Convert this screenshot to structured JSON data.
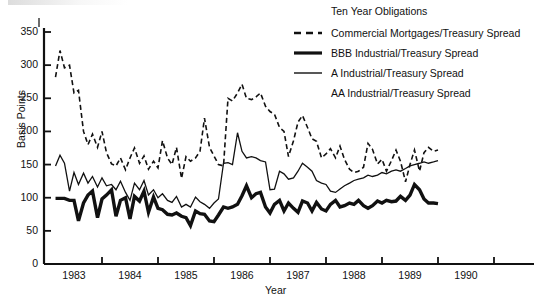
{
  "chart_data": {
    "type": "line",
    "title": "",
    "xlabel": "Year",
    "ylabel": "Basis Points",
    "xlim": [
      1982.6,
      1990.5
    ],
    "ylim": [
      0,
      365
    ],
    "yticks": [
      0,
      50,
      100,
      150,
      200,
      250,
      300,
      350
    ],
    "xticks": [
      1983,
      1984,
      1985,
      1986,
      1987,
      1988,
      1989,
      1990
    ],
    "grid": false,
    "legend_position": "top-right",
    "legend_title": "Ten Year Obligations",
    "series": [
      {
        "name": "Commercial Mortgages/Treasury Spread",
        "style": "dashed",
        "width": 1.6,
        "color": "#111111",
        "x": [
          1982.67,
          1982.75,
          1982.83,
          1982.92,
          1983.0,
          1983.08,
          1983.17,
          1983.25,
          1983.33,
          1983.42,
          1983.5,
          1983.58,
          1983.67,
          1983.75,
          1983.83,
          1983.92,
          1984.0,
          1984.08,
          1984.17,
          1984.25,
          1984.33,
          1984.42,
          1984.5,
          1984.58,
          1984.67,
          1984.75,
          1984.83,
          1984.92,
          1985.0,
          1985.08,
          1985.17,
          1985.25,
          1985.33,
          1985.42,
          1985.5,
          1985.58,
          1985.67,
          1985.75,
          1985.83,
          1985.92,
          1986.0,
          1986.08,
          1986.17,
          1986.25,
          1986.33,
          1986.42,
          1986.5,
          1986.58,
          1986.67,
          1986.75,
          1986.83,
          1986.92,
          1987.0,
          1987.08,
          1987.17,
          1987.25,
          1987.33,
          1987.42,
          1987.5,
          1987.58,
          1987.67,
          1987.75,
          1987.83,
          1987.92,
          1988.0,
          1988.08,
          1988.17,
          1988.25,
          1988.33,
          1988.42,
          1988.5,
          1988.58,
          1988.67,
          1988.75,
          1988.83,
          1988.92,
          1989.0,
          1989.08,
          1989.17,
          1989.25,
          1989.33,
          1989.42,
          1989.5
        ],
        "values": [
          282,
          322,
          296,
          300,
          258,
          262,
          200,
          180,
          196,
          176,
          200,
          168,
          151,
          148,
          160,
          142,
          160,
          175,
          152,
          163,
          143,
          155,
          145,
          186,
          160,
          150,
          176,
          129,
          162,
          155,
          160,
          170,
          220,
          176,
          163,
          150,
          148,
          250,
          246,
          258,
          271,
          250,
          248,
          252,
          258,
          238,
          230,
          226,
          206,
          200,
          162,
          186,
          214,
          224,
          206,
          189,
          185,
          160,
          166,
          174,
          160,
          178,
          158,
          143,
          138,
          140,
          146,
          182,
          173,
          151,
          158,
          140,
          156,
          172,
          155,
          124,
          150,
          172,
          140,
          168,
          176,
          170,
          172
        ]
      },
      {
        "name": "BBB Industrial/Treasury Spread",
        "style": "solid",
        "width": 3.4,
        "color": "#111111",
        "x": [
          1982.67,
          1982.75,
          1982.83,
          1982.92,
          1983.0,
          1983.08,
          1983.17,
          1983.25,
          1983.33,
          1983.42,
          1983.5,
          1983.58,
          1983.67,
          1983.75,
          1983.83,
          1983.92,
          1984.0,
          1984.08,
          1984.17,
          1984.25,
          1984.33,
          1984.42,
          1984.5,
          1984.58,
          1984.67,
          1984.75,
          1984.83,
          1984.92,
          1985.0,
          1985.08,
          1985.17,
          1985.25,
          1985.33,
          1985.42,
          1985.5,
          1985.58,
          1985.67,
          1985.75,
          1985.83,
          1985.92,
          1986.0,
          1986.08,
          1986.17,
          1986.25,
          1986.33,
          1986.42,
          1986.5,
          1986.58,
          1986.67,
          1986.75,
          1986.83,
          1986.92,
          1987.0,
          1987.08,
          1987.17,
          1987.25,
          1987.33,
          1987.42,
          1987.5,
          1987.58,
          1987.67,
          1987.75,
          1987.83,
          1987.92,
          1988.0,
          1988.08,
          1988.17,
          1988.25,
          1988.33,
          1988.42,
          1988.5,
          1988.58,
          1988.67,
          1988.75,
          1988.83,
          1988.92,
          1989.0,
          1989.08,
          1989.17,
          1989.25,
          1989.33,
          1989.42,
          1989.5
        ],
        "values": [
          99,
          99,
          99,
          96,
          96,
          65,
          92,
          104,
          110,
          70,
          98,
          104,
          112,
          72,
          96,
          100,
          68,
          102,
          95,
          110,
          78,
          101,
          84,
          82,
          75,
          74,
          77,
          72,
          70,
          58,
          80,
          76,
          75,
          65,
          64,
          74,
          86,
          84,
          86,
          90,
          103,
          118,
          100,
          106,
          108,
          86,
          77,
          90,
          96,
          80,
          92,
          84,
          78,
          95,
          92,
          80,
          93,
          83,
          80,
          90,
          96,
          86,
          88,
          92,
          90,
          96,
          88,
          84,
          88,
          95,
          92,
          96,
          94,
          95,
          102,
          96,
          104,
          120,
          112,
          98,
          92,
          92,
          91
        ]
      },
      {
        "name": "A Industrial/Treasury Spread",
        "style": "thin",
        "width": 1.3,
        "color": "#111111",
        "x": [
          1982.67,
          1982.75,
          1982.83,
          1982.92,
          1983.0,
          1983.08,
          1983.17,
          1983.25,
          1983.33,
          1983.42,
          1983.5,
          1983.58,
          1983.67,
          1983.75,
          1983.83,
          1983.92,
          1984.0,
          1984.08,
          1984.17,
          1984.25,
          1984.33,
          1984.42,
          1984.5,
          1984.58,
          1984.67,
          1984.75,
          1984.83,
          1984.92,
          1985.0,
          1985.08,
          1985.17,
          1985.25,
          1985.33,
          1985.42,
          1985.5,
          1985.58,
          1985.67,
          1985.75,
          1985.83,
          1985.92,
          1986.0,
          1986.08,
          1986.17,
          1986.25,
          1986.33,
          1986.42,
          1986.5,
          1986.58,
          1986.67,
          1986.75,
          1986.83,
          1986.92,
          1987.0,
          1987.08,
          1987.17,
          1987.25,
          1987.33,
          1987.42,
          1987.5,
          1987.58,
          1987.67,
          1987.75,
          1987.83,
          1987.92,
          1988.0,
          1988.08,
          1988.17,
          1988.25,
          1988.33,
          1988.42,
          1988.5,
          1988.58,
          1988.67,
          1988.75,
          1988.83,
          1988.92,
          1989.0,
          1989.08,
          1989.17,
          1989.25,
          1989.33,
          1989.42,
          1989.5
        ],
        "values": [
          148,
          164,
          152,
          110,
          138,
          120,
          137,
          122,
          132,
          116,
          130,
          118,
          120,
          112,
          125,
          108,
          96,
          122,
          112,
          126,
          104,
          112,
          100,
          106,
          96,
          93,
          102,
          86,
          90,
          86,
          101,
          94,
          90,
          84,
          92,
          98,
          152,
          153,
          150,
          198,
          170,
          160,
          162,
          160,
          156,
          154,
          112,
          113,
          140,
          136,
          128,
          130,
          140,
          152,
          146,
          140,
          126,
          122,
          120,
          110,
          108,
          113,
          118,
          122,
          126,
          128,
          130,
          134,
          132,
          134,
          138,
          136,
          140,
          142,
          140,
          144,
          148,
          150,
          152,
          154,
          152,
          154,
          156
        ]
      }
    ]
  },
  "axes": {
    "y_tick_labels": [
      "350",
      "300",
      "250",
      "200",
      "150",
      "100",
      "50",
      "0"
    ],
    "x_tick_labels": [
      "1983",
      "1984",
      "1985",
      "1986",
      "1987",
      "1988",
      "1989",
      "1990"
    ],
    "y_axis_title": "Basis Points",
    "x_axis_title": "Year"
  },
  "legend": {
    "title": "Ten Year Obligations",
    "items": [
      {
        "label": "Commercial Mortgages/Treasury Spread",
        "marker": "dashed-line-marker"
      },
      {
        "label": "BBB Industrial/Treasury Spread",
        "marker": "thick-solid-line-marker"
      },
      {
        "label": "A Industrial/Treasury Spread",
        "marker": "thin-solid-line-marker"
      },
      {
        "label": "AA Industrial/Treasury Spread",
        "marker": "none"
      }
    ]
  },
  "colors": {
    "ink": "#111111",
    "background": "#ffffff"
  }
}
